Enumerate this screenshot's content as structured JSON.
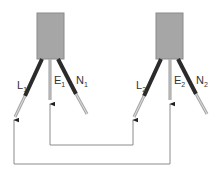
{
  "diagram": {
    "type": "wiring",
    "colors": {
      "box_fill": "#a6a6a6",
      "box_edge": "#8a8a8a",
      "wire_dark": "#2b2b2b",
      "wire_light": "#a8a8a8",
      "earth_wire": "#9a9a9a",
      "connector_line": "#8c8c8c"
    },
    "units": [
      {
        "id": "unit-1",
        "labels": {
          "live": "L",
          "live_sub": "1",
          "earth": "E",
          "earth_sub": "1",
          "neutral": "N",
          "neutral_sub": "1"
        }
      },
      {
        "id": "unit-2",
        "labels": {
          "live": "L",
          "live_sub": "2",
          "earth": "E",
          "earth_sub": "2",
          "neutral": "N",
          "neutral_sub": "2"
        }
      }
    ],
    "connections": [
      {
        "from": "E1",
        "to": "L2",
        "route": "inner loop"
      },
      {
        "from": "E2",
        "to": "L1",
        "route": "outer loop"
      }
    ]
  }
}
